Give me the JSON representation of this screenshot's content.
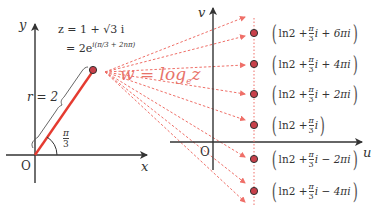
{
  "z_plane": {
    "y_axis_label": "y",
    "x_axis_label": "x",
    "origin_label": "O",
    "r_label": "r = 2",
    "angle_num": "π",
    "angle_den": "3",
    "eq_line1": "z = 1 + √3 i",
    "eq_line2_prefix": "= 2e",
    "eq_line2_exp": "i(π/3 + 2nπ)"
  },
  "mapping": {
    "w_label": "w = log",
    "base": "e",
    "arg": "z"
  },
  "w_plane": {
    "v_axis_label": "v",
    "u_axis_label": "u",
    "origin_label": "O",
    "results": [
      {
        "prefix": "ln2 +",
        "num": "π",
        "den": "3",
        "suffix": "i + 6πi"
      },
      {
        "prefix": "ln2 +",
        "num": "π",
        "den": "3",
        "suffix": "i + 4πi"
      },
      {
        "prefix": "ln2 +",
        "num": "π",
        "den": "3",
        "suffix": "i + 2πi"
      },
      {
        "prefix": "ln2 +",
        "num": "π",
        "den": "3",
        "suffix": "i"
      },
      {
        "prefix": "ln2 +",
        "num": "π",
        "den": "3",
        "suffix": "i − 2πi"
      },
      {
        "prefix": "ln2 +",
        "num": "π",
        "den": "3",
        "suffix": "i − 4πi"
      }
    ]
  },
  "colors": {
    "accent_red": "#e53b30",
    "dashed_red": "#ef6f68",
    "point_fill": "#c8404a",
    "axis": "#333333"
  }
}
